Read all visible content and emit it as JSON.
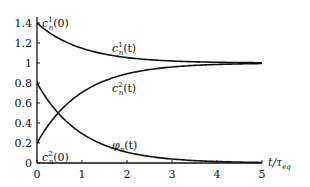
{
  "chart_data": {
    "type": "line",
    "title": "",
    "xlabel": "t/τ_eq",
    "ylabel": "",
    "xlim": [
      0,
      5
    ],
    "ylim": [
      0,
      1.4
    ],
    "grid": false,
    "x_ticks": [
      "0",
      "1",
      "2",
      "3",
      "4",
      "5"
    ],
    "y_ticks": [
      "0",
      "0.2",
      "0.4",
      "0.6",
      "0.8",
      "1",
      "1.2",
      "1.4"
    ],
    "x": [
      0,
      0.5,
      1,
      1.5,
      2,
      2.5,
      3,
      3.5,
      4,
      4.5,
      5
    ],
    "series": [
      {
        "name": "c_n^1(t)",
        "values": [
          1.4,
          1.243,
          1.147,
          1.089,
          1.054,
          1.033,
          1.02,
          1.012,
          1.007,
          1.004,
          1.003
        ]
      },
      {
        "name": "c_n^2(t)",
        "values": [
          0.2,
          0.515,
          0.706,
          0.821,
          0.892,
          0.934,
          0.96,
          0.976,
          0.985,
          0.991,
          0.995
        ]
      },
      {
        "name": "φ_n(t)",
        "values": [
          0.8,
          0.485,
          0.294,
          0.179,
          0.108,
          0.066,
          0.04,
          0.024,
          0.015,
          0.009,
          0.005
        ]
      }
    ],
    "annotations": [
      "c_n^1(0)",
      "c_n^2(0)",
      "c_n^1(t)",
      "c_n^2(t)",
      "φ_n(t)"
    ]
  },
  "labels": {
    "c1_0": "c",
    "c1_0_sup": "1",
    "c1_0_sub": "n",
    "c1_0_arg": "(0)",
    "c2_0": "c",
    "c2_0_sup": "2",
    "c2_0_sub": "n",
    "c2_0_arg": "(0)",
    "c1_t": "c",
    "c1_t_sup": "1",
    "c1_t_sub": "n",
    "c1_t_arg": "(t)",
    "c2_t": "c",
    "c2_t_sup": "2",
    "c2_t_sub": "n",
    "c2_t_arg": "(t)",
    "phi": "φ",
    "phi_sub": "n",
    "phi_arg": "(t)",
    "xaxis": "t/τ",
    "xaxis_sub": "eq"
  }
}
